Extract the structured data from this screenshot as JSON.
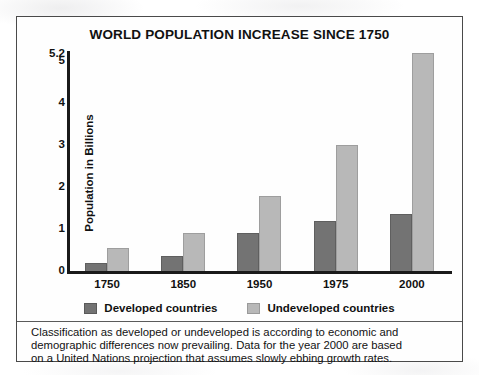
{
  "figure": {
    "title": "WORLD POPULATION INCREASE SINCE 1750",
    "caption_lines": [
      "Classification as developed or undeveloped is according to economic and",
      "demographic differences now prevailing. Data for the year 2000 are based",
      "on a United Nations projection that assumes slowly ebbing growth rates."
    ]
  },
  "colors": {
    "developed": "#737373",
    "undeveloped": "#b8b8b8",
    "axis": "#1a1a1a",
    "frame": "#4a4a4a",
    "text": "#111111",
    "background": "#ffffff"
  },
  "chart_data": {
    "type": "bar",
    "title": "WORLD POPULATION INCREASE SINCE 1750",
    "subtitle": "",
    "xlabel": "",
    "ylabel": "Population in Billions",
    "categories": [
      "1750",
      "1850",
      "1950",
      "1975",
      "2000"
    ],
    "series": [
      {
        "name": "Developed countries",
        "color": "#737373",
        "values": [
          0.2,
          0.35,
          0.9,
          1.2,
          1.35
        ]
      },
      {
        "name": "Undeveloped countries",
        "color": "#b8b8b8",
        "values": [
          0.55,
          0.9,
          1.8,
          3.0,
          5.2
        ]
      }
    ],
    "ylim": [
      0,
      5.2
    ],
    "yticks": [
      "0",
      "1",
      "2",
      "3",
      "4",
      "5"
    ],
    "ytick_values": [
      0,
      1,
      2,
      3,
      4,
      5
    ],
    "ytop_label": "5.2",
    "ytop_value": 5.2,
    "grid": false,
    "legend_position": "bottom",
    "annotations": [
      "Classification as developed or undeveloped is according to economic and demographic differences now prevailing. Data for the year 2000 are based on a United Nations projection that assumes slowly ebbing growth rates."
    ]
  }
}
